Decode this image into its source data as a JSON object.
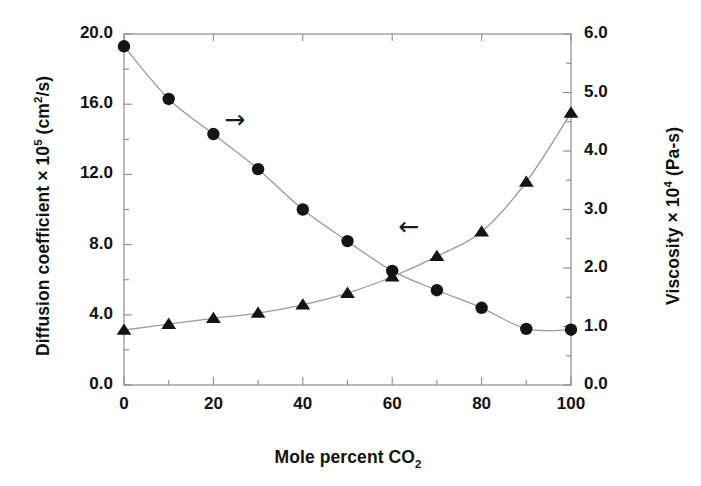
{
  "chart_data": {
    "type": "line",
    "title": "",
    "xlabel": "Mole percent CO2",
    "xlabel_parts": {
      "text": "Mole percent CO",
      "sub": "2"
    },
    "ylabel_left": "Diffusion coefficient × 105 (cm2/s)",
    "ylabel_left_parts": {
      "pre": "Diffusion coefficient × 10",
      "sup": "5",
      "mid": " (cm",
      "sup2": "2",
      "post": "/s)"
    },
    "ylabel_right": "Viscosity × 104 (Pa-s)",
    "ylabel_right_parts": {
      "pre": "Viscosity × 10",
      "sup": "4",
      "post": " (Pa-s)"
    },
    "x": [
      0,
      10,
      20,
      30,
      40,
      50,
      60,
      70,
      80,
      90,
      100
    ],
    "xlim": [
      0,
      100
    ],
    "xticks": [
      "0",
      "20",
      "40",
      "60",
      "80",
      "100"
    ],
    "xtick_values": [
      0,
      20,
      40,
      60,
      80,
      100
    ],
    "xminor_step": 10,
    "ylim_left": [
      0.0,
      20.0
    ],
    "yticks_left": [
      "0.0",
      "4.0",
      "8.0",
      "12.0",
      "16.0",
      "20.0"
    ],
    "ytick_values_left": [
      0.0,
      4.0,
      8.0,
      12.0,
      16.0,
      20.0
    ],
    "ylim_right": [
      0.0,
      6.0
    ],
    "yticks_right": [
      "0.0",
      "1.0",
      "2.0",
      "3.0",
      "4.0",
      "5.0",
      "6.0"
    ],
    "ytick_values_right": [
      0.0,
      1.0,
      2.0,
      3.0,
      4.0,
      5.0,
      6.0
    ],
    "grid": false,
    "legend": "none",
    "series": [
      {
        "name": "Diffusion coefficient",
        "axis": "left",
        "marker": "circle",
        "color": "#141414",
        "values": [
          19.3,
          16.3,
          14.3,
          12.3,
          10.0,
          8.2,
          6.5,
          5.4,
          4.4,
          3.2,
          3.15
        ]
      },
      {
        "name": "Viscosity",
        "axis": "right",
        "marker": "triangle",
        "color": "#141414",
        "values": [
          0.94,
          1.04,
          1.14,
          1.23,
          1.37,
          1.57,
          1.85,
          2.2,
          2.62,
          3.47,
          4.65
        ]
      }
    ],
    "annotations": [
      {
        "name": "arrow-right-diffusion",
        "glyph": "→",
        "x_pct": 26,
        "y_left": 15.0,
        "points_to": "left-axis"
      },
      {
        "name": "arrow-left-viscosity",
        "glyph": "←",
        "x_pct": 65,
        "y_left": 8.9,
        "points_to": "right-axis"
      }
    ]
  },
  "style": {
    "frame_color": "#8d8d8d",
    "line_color": "#9a9a9a",
    "marker_color": "#141414",
    "text_color": "#111111",
    "background": "#ffffff"
  }
}
